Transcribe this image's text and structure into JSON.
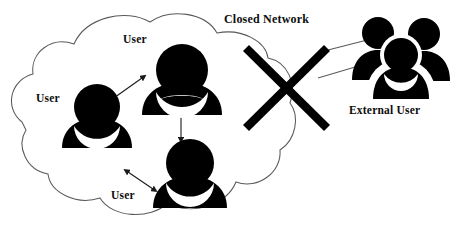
{
  "diagram": {
    "type": "network-boundary-diagram",
    "canvas": {
      "width": 469,
      "height": 238,
      "background": "#ffffff"
    },
    "colors": {
      "figure_fill": "#000000",
      "cloud_stroke": "#595959",
      "arrow_stroke": "#1a1a1a",
      "barrier_fill": "#000000",
      "text": "#0d0d0d",
      "background": "#ffffff"
    },
    "labels": {
      "user_top": "User",
      "user_left": "User",
      "user_bottom": "User",
      "closed_network": "Closed Network",
      "external_user": "External User"
    },
    "nodes": [
      {
        "id": "user-top",
        "icon": "single-user-icon",
        "label": "User",
        "inside_network": true
      },
      {
        "id": "user-left",
        "icon": "single-user-icon",
        "label": "User",
        "inside_network": true
      },
      {
        "id": "user-bottom",
        "icon": "single-user-icon",
        "label": "User",
        "inside_network": true
      },
      {
        "id": "external-user-group",
        "icon": "user-group-icon",
        "label": "External User",
        "inside_network": false,
        "person_count": 3
      }
    ],
    "connections": [
      {
        "from": "user-left",
        "to": "user-top",
        "style": "double-arrow",
        "allowed": true
      },
      {
        "from": "user-top",
        "to": "user-bottom",
        "style": "double-arrow",
        "allowed": true
      },
      {
        "from": "user-left",
        "to": "user-bottom",
        "style": "double-arrow",
        "allowed": true
      },
      {
        "from": "external-user-group",
        "to": "closed-network",
        "style": "thin-line",
        "allowed": false,
        "blocked_by": "barrier-x"
      }
    ],
    "barrier": {
      "id": "barrier-x",
      "shape": "x-cross",
      "meaning": "access blocked"
    }
  }
}
